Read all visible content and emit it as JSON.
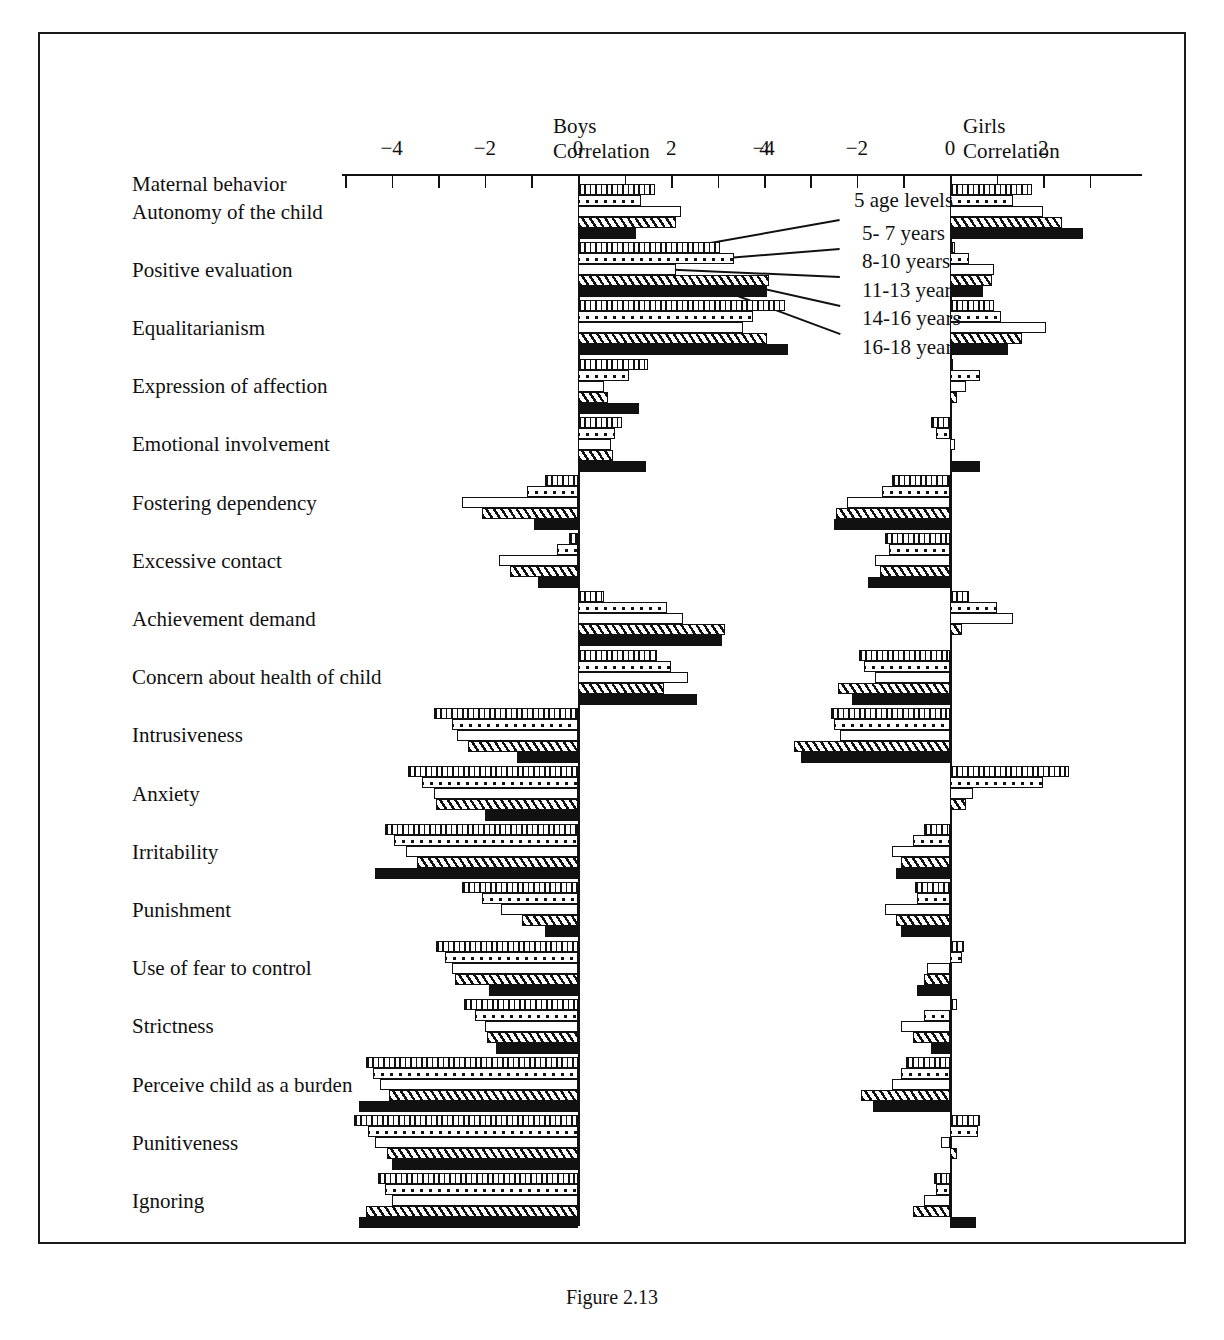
{
  "figure": {
    "row_axis_title": "Maternal behavior",
    "caption": "Figure 2.13",
    "panels": [
      {
        "key": "boys",
        "name": "Boys",
        "subtitle": "Correlation"
      },
      {
        "key": "girls",
        "name": "Girls",
        "subtitle": "Correlation"
      }
    ],
    "legend": {
      "title": "5 age levels",
      "items": [
        "5- 7 years",
        "8-10 years",
        "11-13 years",
        "14-16 years",
        "16-18 years"
      ]
    }
  },
  "chart_data": {
    "type": "bar",
    "orientation": "horizontal",
    "xlabel": "Correlation",
    "ylabel": "Maternal behavior",
    "grid": false,
    "legend_position": "center",
    "series": [
      {
        "name": "5- 7 years",
        "pattern": "vertical-hatch"
      },
      {
        "name": "8-10 years",
        "pattern": "stipple"
      },
      {
        "name": "11-13 years",
        "pattern": "white"
      },
      {
        "name": "14-16 years",
        "pattern": "diagonal-hatch"
      },
      {
        "name": "16-18 years",
        "pattern": "solid-black"
      }
    ],
    "panels": [
      {
        "key": "boys",
        "label": "Boys",
        "sublabel": "Correlation",
        "xlim": [
          -5,
          5
        ],
        "xticks": [
          -4,
          -2,
          0,
          2,
          4
        ],
        "xtick_labels": [
          "−4",
          "−2",
          "0",
          "2",
          "4"
        ],
        "values": {
          "Autonomy of the child": [
            1.65,
            1.35,
            2.2,
            2.1,
            1.25
          ],
          "Positive evaluation": [
            3.05,
            3.35,
            2.1,
            4.1,
            4.05
          ],
          "Equalitarianism": [
            4.45,
            3.75,
            3.55,
            4.05,
            4.5
          ],
          "Expression of affection": [
            1.5,
            1.1,
            0.55,
            0.65,
            1.3
          ],
          "Emotional involvement": [
            0.95,
            0.8,
            0.7,
            0.75,
            1.45
          ],
          "Fostering dependency": [
            -0.7,
            -1.1,
            -2.5,
            -2.05,
            -0.95
          ],
          "Excessive contact": [
            -0.2,
            -0.45,
            -1.7,
            -1.45,
            -0.85
          ],
          "Achievement demand": [
            0.55,
            1.9,
            2.25,
            3.15,
            3.1
          ],
          "Concern about health of child": [
            1.7,
            2.0,
            2.35,
            1.85,
            2.55
          ],
          "Intrusiveness": [
            -3.1,
            -2.7,
            -2.6,
            -2.35,
            -1.3
          ],
          "Anxiety": [
            -3.65,
            -3.35,
            -3.1,
            -3.05,
            -2.0
          ],
          "Irritability": [
            -4.15,
            -3.95,
            -3.7,
            -3.45,
            -4.35
          ],
          "Punishment": [
            -2.5,
            -2.05,
            -1.65,
            -1.2,
            -0.7
          ],
          "Use of fear to control": [
            -3.05,
            -2.85,
            -2.7,
            -2.65,
            -1.9
          ],
          "Strictness": [
            -2.45,
            -2.2,
            -2.0,
            -1.95,
            -1.75
          ],
          "Perceive child as a burden": [
            -4.55,
            -4.4,
            -4.25,
            -4.05,
            -4.7
          ],
          "Punitiveness": [
            -4.8,
            -4.5,
            -4.35,
            -4.1,
            -4.0
          ],
          "Ignoring": [
            -4.3,
            -4.15,
            -4.0,
            -4.55,
            -4.7
          ]
        }
      },
      {
        "key": "girls",
        "label": "Girls",
        "sublabel": "Correlation",
        "xlim": [
          -5,
          3
        ],
        "xticks": [
          -4,
          -2,
          0,
          2
        ],
        "xtick_labels": [
          "−4",
          "−2",
          "0",
          "2"
        ],
        "values": {
          "Autonomy of the child": [
            1.75,
            1.35,
            2.0,
            2.4,
            2.85
          ],
          "Positive evaluation": [
            0.1,
            0.4,
            0.95,
            0.9,
            0.7
          ],
          "Equalitarianism": [
            0.95,
            1.1,
            2.05,
            1.55,
            1.25
          ],
          "Expression of affection": [
            0.07,
            0.65,
            0.35,
            0.15,
            0.0
          ],
          "Emotional involvement": [
            -0.4,
            -0.3,
            0.1,
            0.0,
            0.65
          ],
          "Fostering dependency": [
            -1.25,
            -1.45,
            -2.2,
            -2.45,
            -2.5
          ],
          "Excessive contact": [
            -1.4,
            -1.3,
            -1.6,
            -1.5,
            -1.75
          ],
          "Achievement demand": [
            0.4,
            1.0,
            1.35,
            0.25,
            0.0
          ],
          "Concern about health of child": [
            -1.95,
            -1.85,
            -1.6,
            -2.4,
            -2.1
          ],
          "Intrusiveness": [
            -2.55,
            -2.5,
            -2.35,
            -3.35,
            -3.2
          ],
          "Anxiety": [
            2.55,
            2.0,
            0.5,
            0.35,
            0.0
          ],
          "Irritability": [
            -0.55,
            -0.8,
            -1.25,
            -1.05,
            -1.15
          ],
          "Punishment": [
            -0.75,
            -0.7,
            -1.4,
            -1.15,
            -1.05
          ],
          "Use of fear to control": [
            0.3,
            0.25,
            -0.5,
            -0.55,
            -0.7
          ],
          "Strictness": [
            0.15,
            -0.55,
            -1.05,
            -0.8,
            -0.4
          ],
          "Perceive child as a burden": [
            -0.95,
            -1.05,
            -1.25,
            -1.9,
            -1.65
          ],
          "Punitiveness": [
            0.65,
            0.6,
            -0.2,
            0.15,
            0.0
          ],
          "Ignoring": [
            -0.35,
            -0.3,
            -0.55,
            -0.8,
            0.55
          ]
        }
      }
    ],
    "categories": [
      "Autonomy of the child",
      "Positive evaluation",
      "Equalitarianism",
      "Expression of affection",
      "Emotional involvement",
      "Fostering dependency",
      "Excessive contact",
      "Achievement demand",
      "Concern about health of child",
      "Intrusiveness",
      "Anxiety",
      "Irritability",
      "Punishment",
      "Use of fear to control",
      "Strictness",
      "Perceive child as a burden",
      "Punitiveness",
      "Ignoring"
    ]
  },
  "layout": {
    "boys": {
      "zero_x": 576,
      "unit_px": 46.6,
      "axis_left": 340,
      "axis_right": 790
    },
    "girls": {
      "zero_x": 948,
      "unit_px": 46.6,
      "axis_left": 786,
      "axis_right": 1140
    },
    "axis_y": 172,
    "row_start_y": 182,
    "row_step": 58.2,
    "bar_h": 11
  }
}
